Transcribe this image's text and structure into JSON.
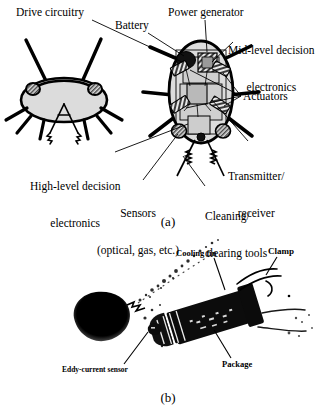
{
  "figure": {
    "panels": [
      {
        "id": "a",
        "letter": "(a)",
        "type": "schematic-line-art",
        "description": "Line drawing of an insect-like microrobot: front view (left) and top view with internal components (right)",
        "labels": [
          {
            "id": "drive-circuitry",
            "text": "Drive circuitry"
          },
          {
            "id": "battery",
            "text": "Battery"
          },
          {
            "id": "power-generator",
            "text": "Power generator"
          },
          {
            "id": "mid-level",
            "line1": "Mid-level decision",
            "line2": "electronics"
          },
          {
            "id": "actuators",
            "text": "Actuators"
          },
          {
            "id": "transmitter",
            "line1": "Transmitter/",
            "line2": "receiver"
          },
          {
            "id": "high-level",
            "line1": "High-level decision",
            "line2": "electronics"
          },
          {
            "id": "sensors",
            "line1": "Sensors",
            "line2": "(optical, gas, etc.)"
          },
          {
            "id": "cleaning-tools",
            "line1": "Cleaning/",
            "line2": "clearing tools"
          }
        ]
      },
      {
        "id": "b",
        "letter": "(b)",
        "type": "photograph-halftone",
        "description": "High-contrast photograph of an assembled micro-robot package resting on a surface",
        "labels": [
          {
            "id": "cooling-fin",
            "text": "Cooling fin"
          },
          {
            "id": "clamp",
            "text": "Clamp"
          },
          {
            "id": "package",
            "text": "Package"
          },
          {
            "id": "eddy-current-sensor",
            "text": "Eddy-current sensor"
          }
        ]
      }
    ]
  },
  "colors": {
    "ink": "#000000",
    "paper": "#ffffff",
    "body_fill": "#d9d9d9",
    "block_fill": "#c2c2c2",
    "block_fill_dark": "#8f8f8f",
    "hatch": "#4d4d4d"
  }
}
